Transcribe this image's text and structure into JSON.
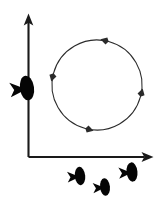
{
  "figure": {
    "type": "schematic-diagram",
    "title": "",
    "background_color": "#ffffff",
    "width": 163,
    "height": 206
  },
  "axes": {
    "stroke_color": "#1a1a1a",
    "origin": {
      "x": 28,
      "y": 157
    },
    "y_axis": {
      "label": "",
      "tick_labels": [],
      "from": {
        "x": 28,
        "y": 157
      },
      "to": {
        "x": 28,
        "y": 18
      },
      "arrow_direction": "up"
    },
    "x_axis": {
      "label": "",
      "tick_labels": [],
      "from": {
        "x": 28,
        "y": 157
      },
      "to": {
        "x": 150,
        "y": 157
      },
      "arrow_direction": "right"
    }
  },
  "cycle": {
    "label": "",
    "direction": "counterclockwise",
    "center": {
      "x": 97,
      "y": 85
    },
    "radius": 45,
    "stroke_color": "#2b2b2b",
    "segment_count": 4,
    "segments": [
      {
        "name": "top-left-arc",
        "start_angle_deg": 285,
        "end_angle_deg": 195,
        "arrow_at": "end",
        "arrow_points": "down-left"
      },
      {
        "name": "bottom-left-arc",
        "start_angle_deg": 195,
        "end_angle_deg": 105,
        "arrow_at": "end",
        "arrow_points": "right"
      },
      {
        "name": "bottom-right-arc",
        "start_angle_deg": 105,
        "end_angle_deg": 15,
        "arrow_at": "end",
        "arrow_points": "up"
      },
      {
        "name": "top-right-arc",
        "start_angle_deg": 15,
        "end_angle_deg": 285,
        "arrow_at": "end",
        "arrow_points": "left"
      }
    ]
  },
  "silhouettes": {
    "fill_color": "#050505",
    "items": [
      {
        "name": "fish-on-y-axis",
        "x": 27,
        "y": 88,
        "scale": 1.35,
        "rotation_deg": -8,
        "facing": "left"
      },
      {
        "name": "fish-below-axis-left",
        "x": 80,
        "y": 176,
        "scale": 1.0,
        "rotation_deg": -6,
        "facing": "left"
      },
      {
        "name": "fish-below-axis-middle",
        "x": 105,
        "y": 187,
        "scale": 0.95,
        "rotation_deg": -6,
        "facing": "left"
      },
      {
        "name": "fish-below-axis-right",
        "x": 132,
        "y": 172,
        "scale": 1.05,
        "rotation_deg": -6,
        "facing": "left"
      }
    ]
  }
}
